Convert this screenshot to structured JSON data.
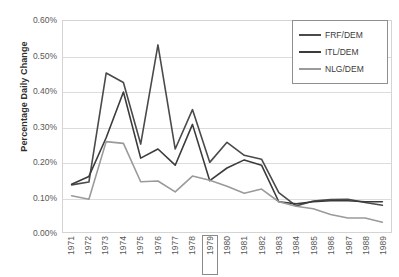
{
  "chart_data": {
    "type": "line",
    "title": "",
    "subtitle": "",
    "xlabel": "",
    "ylabel": "Percentage Daily Change",
    "categories": [
      "1971",
      "1972",
      "1973",
      "1974",
      "1975",
      "1976",
      "1977",
      "1978",
      "1979",
      "1980",
      "1981",
      "1982",
      "1983",
      "1984",
      "1985",
      "1986",
      "1987",
      "1988",
      "1989"
    ],
    "ytick_labels": [
      "0.60%",
      "0.50%",
      "0.40%",
      "0.30%",
      "0.20%",
      "0.10%",
      "0.00%"
    ],
    "ytick_values": [
      0.6,
      0.5,
      0.4,
      0.3,
      0.2,
      0.1,
      0.0
    ],
    "ylim": [
      0.0,
      0.6
    ],
    "y_unit": "%",
    "grid": true,
    "legend_position": "top-right",
    "highlighted_category": "1979",
    "series": [
      {
        "name": "FRF/DEM",
        "color": "#4a4a4a",
        "values": [
          0.134,
          0.142,
          0.452,
          0.425,
          0.25,
          0.532,
          0.236,
          0.348,
          0.198,
          0.255,
          0.218,
          0.207,
          0.112,
          0.074,
          0.088,
          0.092,
          0.093,
          0.084,
          0.076
        ]
      },
      {
        "name": "ITL/DEM",
        "color": "#3b3b3b",
        "values": [
          0.136,
          0.158,
          0.268,
          0.398,
          0.21,
          0.236,
          0.19,
          0.306,
          0.146,
          0.182,
          0.205,
          0.19,
          0.086,
          0.08,
          0.086,
          0.089,
          0.089,
          0.086,
          0.086
        ]
      },
      {
        "name": "NLG/DEM",
        "color": "#9a9a9a",
        "values": [
          0.103,
          0.093,
          0.257,
          0.252,
          0.143,
          0.145,
          0.114,
          0.159,
          0.147,
          0.13,
          0.11,
          0.122,
          0.086,
          0.073,
          0.066,
          0.05,
          0.04,
          0.04,
          0.028
        ]
      }
    ]
  },
  "legend": {
    "items": [
      {
        "label": "FRF/DEM"
      },
      {
        "label": "ITL/DEM"
      },
      {
        "label": "NLG/DEM"
      }
    ]
  }
}
